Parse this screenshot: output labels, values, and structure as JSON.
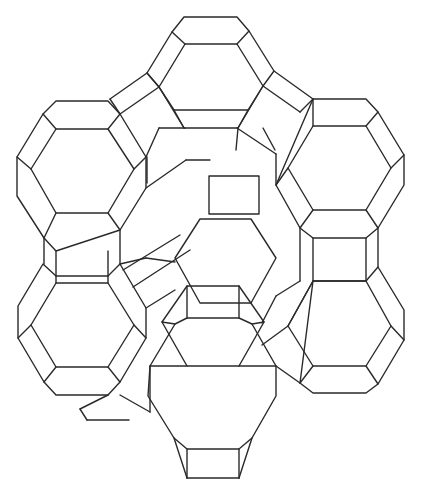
{
  "figure": {
    "title": "",
    "stroke_color": "#2a2a2a",
    "background": "#ffffff",
    "hex_prisms": [
      {
        "name": "top-center",
        "outer": [
          [
            184,
            17
          ],
          [
            237,
            17
          ],
          [
            249,
            31
          ],
          [
            274,
            71
          ],
          [
            263,
            86
          ],
          [
            248,
            110
          ],
          [
            174,
            110
          ],
          [
            159,
            87
          ],
          [
            147,
            73
          ],
          [
            172,
            32
          ]
        ],
        "inner": [
          [
            185,
            44
          ],
          [
            237,
            44
          ],
          [
            263,
            86
          ],
          [
            238,
            128
          ],
          [
            184,
            128
          ],
          [
            159,
            87
          ]
        ]
      },
      {
        "name": "upper-left",
        "outer": [
          [
            56,
            101
          ],
          [
            108,
            101
          ],
          [
            120,
            114
          ],
          [
            146,
            157
          ],
          [
            146,
            188
          ],
          [
            120,
            230
          ],
          [
            56,
            251
          ],
          [
            44,
            238
          ],
          [
            17,
            196
          ],
          [
            17,
            157
          ],
          [
            43,
            114
          ]
        ],
        "inner": [
          [
            56,
            129
          ],
          [
            108,
            129
          ],
          [
            134,
            169
          ],
          [
            108,
            213
          ],
          [
            56,
            213
          ],
          [
            31,
            169
          ]
        ]
      },
      {
        "name": "upper-right",
        "outer": [
          [
            313,
            99
          ],
          [
            366,
            99
          ],
          [
            378,
            112
          ],
          [
            404,
            155
          ],
          [
            404,
            185
          ],
          [
            378,
            228
          ],
          [
            366,
            238
          ],
          [
            313,
            238
          ],
          [
            300,
            228
          ],
          [
            276,
            185
          ]
        ],
        "inner": [
          [
            313,
            126
          ],
          [
            366,
            126
          ],
          [
            391,
            168
          ],
          [
            366,
            210
          ],
          [
            313,
            210
          ],
          [
            288,
            168
          ]
        ]
      },
      {
        "name": "lower-left",
        "outer": [
          [
            56,
            276
          ],
          [
            108,
            276
          ],
          [
            120,
            264
          ],
          [
            146,
            308
          ],
          [
            146,
            338
          ],
          [
            120,
            382
          ],
          [
            108,
            395
          ],
          [
            56,
            395
          ],
          [
            44,
            382
          ],
          [
            18,
            338
          ],
          [
            18,
            306
          ],
          [
            43,
            264
          ]
        ],
        "inner": [
          [
            56,
            283
          ],
          [
            108,
            283
          ],
          [
            134,
            325
          ],
          [
            108,
            367
          ],
          [
            56,
            367
          ],
          [
            31,
            325
          ]
        ]
      },
      {
        "name": "lower-right",
        "outer": [
          [
            313,
            281
          ],
          [
            366,
            281
          ],
          [
            378,
            267
          ],
          [
            404,
            310
          ],
          [
            404,
            340
          ],
          [
            378,
            384
          ],
          [
            366,
            393
          ],
          [
            313,
            393
          ],
          [
            300,
            383
          ]
        ],
        "inner": [
          [
            313,
            281
          ],
          [
            366,
            281
          ],
          [
            391,
            326
          ],
          [
            366,
            366
          ],
          [
            313,
            366
          ],
          [
            288,
            326
          ]
        ]
      },
      {
        "name": "bottom-center",
        "outer": [
          [
            187,
            449
          ],
          [
            239,
            449
          ],
          [
            252,
            438
          ],
          [
            276,
            396
          ],
          [
            276,
            366
          ],
          [
            252,
            324
          ],
          [
            239,
            318
          ],
          [
            187,
            318
          ],
          [
            175,
            324
          ],
          [
            150,
            366
          ],
          [
            148,
            396
          ],
          [
            174,
            438
          ]
        ],
        "inner": [
          [
            187,
            366
          ],
          [
            239,
            366
          ],
          [
            264,
            322
          ],
          [
            239,
            286
          ],
          [
            187,
            286
          ],
          [
            162,
            322
          ]
        ]
      }
    ],
    "back_hexagon": {
      "inner": [
        [
          200,
          219
        ],
        [
          251,
          219
        ],
        [
          276,
          258
        ],
        [
          251,
          303
        ],
        [
          200,
          303
        ],
        [
          175,
          258
        ]
      ],
      "top_square": [
        [
          209,
          176
        ],
        [
          259,
          176
        ],
        [
          259,
          214
        ],
        [
          209,
          214
        ]
      ]
    },
    "lines": [
      [
        [
          147,
          73
        ],
        [
          110,
          99
        ]
      ],
      [
        [
          159,
          87
        ],
        [
          120,
          114
        ]
      ],
      [
        [
          110,
          99
        ],
        [
          120,
          114
        ]
      ],
      [
        [
          147,
          73
        ],
        [
          159,
          87
        ]
      ],
      [
        [
          274,
          71
        ],
        [
          313,
          99
        ]
      ],
      [
        [
          263,
          86
        ],
        [
          300,
          112
        ]
      ],
      [
        [
          313,
          99
        ],
        [
          300,
          112
        ]
      ],
      [
        [
          146,
          157
        ],
        [
          159,
          128
        ]
      ],
      [
        [
          159,
          128
        ],
        [
          185,
          128
        ]
      ],
      [
        [
          146,
          188
        ],
        [
          186,
          160
        ]
      ],
      [
        [
          186,
          160
        ],
        [
          210,
          160
        ]
      ],
      [
        [
          147,
          157
        ],
        [
          147,
          183
        ]
      ],
      [
        [
          237,
          128
        ],
        [
          276,
          154
        ]
      ],
      [
        [
          263,
          128
        ],
        [
          275,
          150
        ]
      ],
      [
        [
          276,
          154
        ],
        [
          276,
          185
        ]
      ],
      [
        [
          238,
          128
        ],
        [
          236,
          150
        ]
      ],
      [
        [
          56,
          251
        ],
        [
          56,
          276
        ]
      ],
      [
        [
          108,
          251
        ],
        [
          108,
          276
        ]
      ],
      [
        [
          44,
          238
        ],
        [
          44,
          264
        ]
      ],
      [
        [
          120,
          230
        ],
        [
          120,
          264
        ]
      ],
      [
        [
          313,
          238
        ],
        [
          313,
          281
        ]
      ],
      [
        [
          366,
          238
        ],
        [
          366,
          281
        ]
      ],
      [
        [
          378,
          228
        ],
        [
          378,
          267
        ]
      ],
      [
        [
          300,
          228
        ],
        [
          300,
          281
        ]
      ],
      [
        [
          120,
          264
        ],
        [
          146,
          258
        ]
      ],
      [
        [
          146,
          258
        ],
        [
          175,
          262
        ]
      ],
      [
        [
          123,
          270
        ],
        [
          180,
          235
        ]
      ],
      [
        [
          133,
          287
        ],
        [
          190,
          250
        ]
      ],
      [
        [
          146,
          308
        ],
        [
          175,
          290
        ]
      ],
      [
        [
          300,
          281
        ],
        [
          276,
          296
        ]
      ],
      [
        [
          276,
          296
        ],
        [
          262,
          323
        ]
      ],
      [
        [
          288,
          326
        ],
        [
          262,
          345
        ]
      ],
      [
        [
          276,
          366
        ],
        [
          300,
          383
        ]
      ],
      [
        [
          108,
          395
        ],
        [
          80,
          409
        ]
      ],
      [
        [
          80,
          409
        ],
        [
          87,
          420
        ]
      ],
      [
        [
          87,
          420
        ],
        [
          129,
          420
        ]
      ],
      [
        [
          120,
          395
        ],
        [
          150,
          412
        ]
      ],
      [
        [
          150,
          366
        ],
        [
          150,
          412
        ]
      ],
      [
        [
          187,
          449
        ],
        [
          187,
          478
        ]
      ],
      [
        [
          239,
          449
        ],
        [
          239,
          478
        ]
      ],
      [
        [
          187,
          478
        ],
        [
          239,
          478
        ]
      ],
      [
        [
          174,
          438
        ],
        [
          187,
          478
        ]
      ],
      [
        [
          252,
          438
        ],
        [
          239,
          478
        ]
      ]
    ]
  }
}
